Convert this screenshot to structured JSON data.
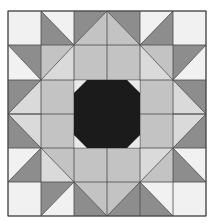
{
  "colors": {
    "light": "#f1f1f1",
    "lighter_mid": "#dadada",
    "medium": "#c3c3c3",
    "dark": "#8d8d8d",
    "black": "#1b1b1b",
    "corner": "#e9e9e9",
    "line": "#4a4a4a"
  },
  "grid": {
    "cols": [
      8,
      41,
      74,
      107,
      140,
      173,
      206
    ],
    "rows": [
      11,
      45,
      80,
      114,
      148,
      182,
      216
    ]
  },
  "cells": [
    {
      "r": 0,
      "c": 0,
      "type": "solid",
      "fill": "light"
    },
    {
      "r": 0,
      "c": 1,
      "type": "diag",
      "dir": "tlbr",
      "a": "light",
      "b": "dark"
    },
    {
      "r": 0,
      "c": 2,
      "type": "diag",
      "dir": "bltr",
      "a": "dark",
      "b": "medium"
    },
    {
      "r": 0,
      "c": 3,
      "type": "diag",
      "dir": "tlbr",
      "a": "dark",
      "b": "medium"
    },
    {
      "r": 0,
      "c": 4,
      "type": "diag",
      "dir": "bltr",
      "a": "light",
      "b": "dark"
    },
    {
      "r": 0,
      "c": 5,
      "type": "solid",
      "fill": "light"
    },
    {
      "r": 1,
      "c": 0,
      "type": "diag",
      "dir": "tlbr",
      "a": "dark",
      "b": "light"
    },
    {
      "r": 1,
      "c": 1,
      "type": "diag",
      "dir": "bltr",
      "a": "medium",
      "b": "lighter_mid"
    },
    {
      "r": 1,
      "c": 4,
      "type": "diag",
      "dir": "tlbr",
      "a": "medium",
      "b": "lighter_mid"
    },
    {
      "r": 1,
      "c": 5,
      "type": "diag",
      "dir": "bltr",
      "a": "dark",
      "b": "light"
    },
    {
      "r": 4,
      "c": 0,
      "type": "diag",
      "dir": "bltr",
      "a": "light",
      "b": "dark"
    },
    {
      "r": 4,
      "c": 1,
      "type": "diag",
      "dir": "tlbr",
      "a": "medium",
      "b": "lighter_mid"
    },
    {
      "r": 4,
      "c": 4,
      "type": "diag",
      "dir": "bltr",
      "a": "lighter_mid",
      "b": "medium"
    },
    {
      "r": 4,
      "c": 5,
      "type": "diag",
      "dir": "tlbr",
      "a": "light",
      "b": "dark"
    },
    {
      "r": 5,
      "c": 0,
      "type": "solid",
      "fill": "light"
    },
    {
      "r": 5,
      "c": 1,
      "type": "diag",
      "dir": "bltr",
      "a": "dark",
      "b": "light"
    },
    {
      "r": 5,
      "c": 2,
      "type": "diag",
      "dir": "tlbr",
      "a": "medium",
      "b": "dark"
    },
    {
      "r": 5,
      "c": 3,
      "type": "diag",
      "dir": "bltr",
      "a": "medium",
      "b": "dark"
    },
    {
      "r": 5,
      "c": 4,
      "type": "diag",
      "dir": "tlbr",
      "a": "light",
      "b": "dark"
    },
    {
      "r": 5,
      "c": 5,
      "type": "solid",
      "fill": "light"
    }
  ],
  "blocks": {
    "top_center": {
      "c0": 2,
      "r0": 1,
      "c1": 4,
      "r1": 2,
      "fill": "medium"
    },
    "bottom_center": {
      "c0": 2,
      "r0": 4,
      "c1": 4,
      "r1": 5,
      "fill": "medium"
    },
    "left_center": {
      "c0": 1,
      "r0": 2,
      "c1": 2,
      "r1": 4,
      "fill": "medium"
    },
    "right_center": {
      "c0": 4,
      "r0": 2,
      "c1": 5,
      "r1": 4,
      "fill": "medium"
    },
    "left_arrow": {
      "c0": 0,
      "r0": 2,
      "c1": 1,
      "r1": 4,
      "bg": "dark",
      "fg": "lighter_mid",
      "point": "left"
    },
    "right_arrow": {
      "c0": 5,
      "r0": 2,
      "c1": 6,
      "r1": 4,
      "bg": "dark",
      "fg": "lighter_mid",
      "point": "right"
    },
    "center": {
      "c0": 2,
      "r0": 2,
      "c1": 4,
      "r1": 4,
      "bg": "corner",
      "octagon": "black",
      "cut": 13
    }
  }
}
